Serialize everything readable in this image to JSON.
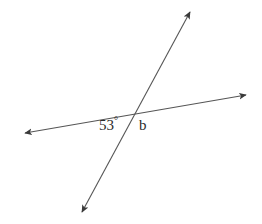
{
  "figure": {
    "type": "two-intersecting-lines-angle-diagram",
    "canvas": {
      "width": 262,
      "height": 224,
      "background": "#ffffff"
    },
    "stroke_color": "#555555",
    "stroke_width": 1.1,
    "text_color": "#2b2b2b",
    "intersection": {
      "x": 133,
      "y": 113
    },
    "lines": [
      {
        "name": "transversal-line",
        "description": "near-horizontal line rising to the right",
        "x1": 25,
        "y1": 133,
        "x2": 246,
        "y2": 95,
        "arrow_start": true,
        "arrow_end": true
      },
      {
        "name": "steep-line",
        "description": "steep line rising to the upper right",
        "x1": 82,
        "y1": 212,
        "x2": 190,
        "y2": 12,
        "arrow_start": true,
        "arrow_end": true
      }
    ],
    "labels": [
      {
        "name": "angle-label-53",
        "value": "53",
        "degree_symbol": "°",
        "text": "53°",
        "x": 99,
        "y": 116
      },
      {
        "name": "angle-label-b",
        "value": "b",
        "text": "b",
        "x": 139,
        "y": 118
      }
    ]
  }
}
